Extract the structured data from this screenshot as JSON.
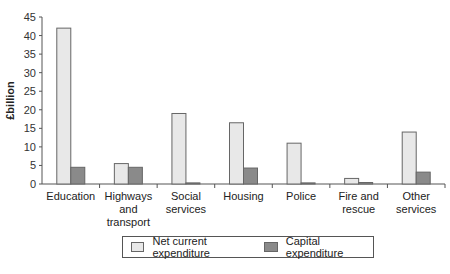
{
  "chart_data": {
    "type": "bar",
    "title": "",
    "xlabel": "",
    "ylabel": "£billion",
    "ylim": [
      0,
      45
    ],
    "yticks": [
      0,
      5,
      10,
      15,
      20,
      25,
      30,
      35,
      40,
      45
    ],
    "grid": false,
    "legend_position": "bottom",
    "categories": [
      [
        "Education"
      ],
      [
        "Highways",
        "and",
        "transport"
      ],
      [
        "Social",
        "services"
      ],
      [
        "Housing"
      ],
      [
        "Police"
      ],
      [
        "Fire and",
        "rescue"
      ],
      [
        "Other",
        "services"
      ]
    ],
    "series": [
      {
        "name": "Net current expenditure",
        "color": "#e8e8e8",
        "values": [
          42,
          5.5,
          19,
          16.5,
          11,
          1.5,
          14
        ]
      },
      {
        "name": "Capital expenditure",
        "color": "#8a8a8a",
        "values": [
          4.5,
          4.5,
          0.3,
          4.3,
          0.3,
          0.4,
          3.2
        ]
      }
    ]
  },
  "legend": {
    "net_label": "Net current expenditure",
    "capital_label": "Capital expenditure"
  }
}
